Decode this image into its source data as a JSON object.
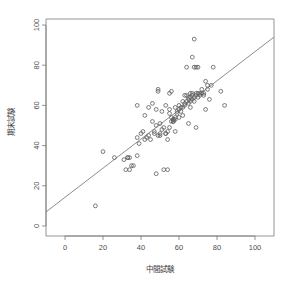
{
  "chart_data": {
    "type": "scatter",
    "title": "",
    "xlabel": "中間試験",
    "ylabel": "期末試験",
    "xlim": [
      -10,
      110
    ],
    "ylim": [
      -5,
      103
    ],
    "xticks": [
      0,
      20,
      40,
      60,
      80,
      100
    ],
    "yticks": [
      0,
      20,
      40,
      60,
      80,
      100
    ],
    "xtick_labels": [
      "0",
      "20",
      "40",
      "60",
      "80",
      "100"
    ],
    "ytick_labels": [
      "0",
      "20",
      "40",
      "60",
      "80",
      "100"
    ],
    "grid": false,
    "legend": null,
    "marker": "open-circle",
    "marker_color": "#5a5a5a",
    "line_color": "#6e6e6e",
    "frame_color": "#7a7a7a",
    "regression_line": {
      "label": "fitted line",
      "x_start": -10,
      "y_start": 7,
      "x_end": 110,
      "y_end": 94,
      "slope": 0.725,
      "intercept": 14.25
    },
    "points": [
      [
        16,
        10
      ],
      [
        20,
        37
      ],
      [
        26,
        34
      ],
      [
        31,
        33
      ],
      [
        32,
        28
      ],
      [
        33,
        34
      ],
      [
        33,
        34
      ],
      [
        34,
        34
      ],
      [
        34,
        28
      ],
      [
        35,
        30
      ],
      [
        36,
        30
      ],
      [
        38,
        35
      ],
      [
        38,
        60
      ],
      [
        38,
        44
      ],
      [
        39,
        41
      ],
      [
        40,
        46
      ],
      [
        41,
        47
      ],
      [
        42,
        55
      ],
      [
        42,
        43
      ],
      [
        43,
        44
      ],
      [
        44,
        59
      ],
      [
        44,
        45
      ],
      [
        45,
        43
      ],
      [
        46,
        61
      ],
      [
        46,
        52
      ],
      [
        47,
        47
      ],
      [
        47,
        46
      ],
      [
        48,
        26
      ],
      [
        48,
        58
      ],
      [
        48,
        50
      ],
      [
        49,
        45
      ],
      [
        49,
        67
      ],
      [
        49,
        68
      ],
      [
        50,
        51
      ],
      [
        50,
        46
      ],
      [
        50,
        45
      ],
      [
        51,
        57
      ],
      [
        51,
        48
      ],
      [
        52,
        49
      ],
      [
        52,
        28
      ],
      [
        53,
        46
      ],
      [
        53,
        46
      ],
      [
        53,
        60
      ],
      [
        54,
        47
      ],
      [
        54,
        43
      ],
      [
        54,
        28
      ],
      [
        55,
        49
      ],
      [
        55,
        56
      ],
      [
        55,
        58
      ],
      [
        55,
        66
      ],
      [
        56,
        67
      ],
      [
        56,
        52
      ],
      [
        56,
        54
      ],
      [
        57,
        52
      ],
      [
        57,
        52
      ],
      [
        57,
        53
      ],
      [
        57,
        53
      ],
      [
        58,
        47
      ],
      [
        58,
        53
      ],
      [
        58,
        54
      ],
      [
        58,
        59
      ],
      [
        59,
        57
      ],
      [
        59,
        56
      ],
      [
        60,
        58
      ],
      [
        60,
        60
      ],
      [
        60,
        54
      ],
      [
        61,
        57
      ],
      [
        61,
        59
      ],
      [
        62,
        62
      ],
      [
        62,
        59
      ],
      [
        62,
        55
      ],
      [
        63,
        60
      ],
      [
        63,
        65
      ],
      [
        63,
        61
      ],
      [
        64,
        62
      ],
      [
        64,
        79
      ],
      [
        64,
        65
      ],
      [
        65,
        61
      ],
      [
        65,
        64
      ],
      [
        65,
        63
      ],
      [
        65,
        51
      ],
      [
        66,
        64
      ],
      [
        66,
        66
      ],
      [
        66,
        62
      ],
      [
        66,
        59
      ],
      [
        67,
        63
      ],
      [
        67,
        65
      ],
      [
        67,
        66
      ],
      [
        67,
        84
      ],
      [
        68,
        93
      ],
      [
        68,
        62
      ],
      [
        68,
        64
      ],
      [
        68,
        79
      ],
      [
        69,
        66
      ],
      [
        69,
        79
      ],
      [
        69,
        65
      ],
      [
        69,
        49
      ],
      [
        70,
        64
      ],
      [
        70,
        79
      ],
      [
        70,
        66
      ],
      [
        71,
        66
      ],
      [
        71,
        65
      ],
      [
        72,
        66
      ],
      [
        72,
        68
      ],
      [
        73,
        65
      ],
      [
        73,
        66
      ],
      [
        74,
        72
      ],
      [
        74,
        58
      ],
      [
        75,
        68
      ],
      [
        75,
        70
      ],
      [
        76,
        63
      ],
      [
        77,
        70
      ],
      [
        78,
        79
      ],
      [
        82,
        67
      ],
      [
        84,
        60
      ]
    ]
  }
}
